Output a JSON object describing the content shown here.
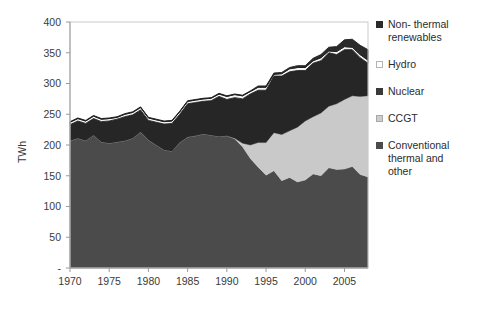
{
  "chart_data": {
    "type": "area",
    "title": "",
    "xlabel": "",
    "ylabel": "TWh",
    "xlim": [
      1970,
      2008
    ],
    "ylim": [
      0,
      400
    ],
    "ytick_labels": [
      "-",
      "50",
      "100",
      "150",
      "200",
      "250",
      "300",
      "350",
      "400"
    ],
    "ytick_values": [
      0,
      50,
      100,
      150,
      200,
      250,
      300,
      350,
      400
    ],
    "xtick_labels": [
      "1970",
      "1975",
      "1980",
      "1985",
      "1990",
      "1995",
      "2000",
      "2005"
    ],
    "xtick_values": [
      1970,
      1975,
      1980,
      1985,
      1990,
      1995,
      2000,
      2005
    ],
    "grid": false,
    "stacked": true,
    "legend_position": "right",
    "x": [
      1970,
      1971,
      1972,
      1973,
      1974,
      1975,
      1976,
      1977,
      1978,
      1979,
      1980,
      1981,
      1982,
      1983,
      1984,
      1985,
      1986,
      1987,
      1988,
      1989,
      1990,
      1991,
      1992,
      1993,
      1994,
      1995,
      1996,
      1997,
      1998,
      1999,
      2000,
      2001,
      2002,
      2003,
      2004,
      2005,
      2006,
      2007,
      2008
    ],
    "series": [
      {
        "name": "Conventional thermal and other",
        "color": "#4b4b4b",
        "values": [
          207,
          211,
          207,
          216,
          205,
          203,
          205,
          207,
          211,
          221,
          208,
          200,
          192,
          190,
          204,
          213,
          215,
          218,
          216,
          214,
          215,
          210,
          197,
          178,
          164,
          151,
          158,
          142,
          147,
          140,
          143,
          153,
          150,
          163,
          160,
          161,
          165,
          152,
          148
        ]
      },
      {
        "name": "CCGT",
        "color": "#c9c9c9",
        "values": [
          0,
          0,
          0,
          0,
          0,
          0,
          0,
          0,
          0,
          0,
          0,
          0,
          0,
          0,
          0,
          0,
          0,
          0,
          0,
          0,
          0,
          1,
          6,
          22,
          40,
          53,
          62,
          75,
          76,
          89,
          96,
          93,
          102,
          100,
          107,
          113,
          115,
          127,
          132
        ]
      },
      {
        "name": "Nuclear",
        "color": "#262626",
        "values": [
          26,
          28,
          28,
          27,
          33,
          36,
          37,
          39,
          38,
          36,
          32,
          37,
          42,
          45,
          46,
          54,
          54,
          53,
          56,
          65,
          59,
          66,
          72,
          83,
          85,
          85,
          92,
          95,
          96,
          92,
          82,
          87,
          85,
          87,
          80,
          81,
          75,
          63,
          53
        ]
      },
      {
        "name": "Hydro",
        "color": "#f4f4f4",
        "values": [
          4,
          4,
          4,
          4,
          4,
          4,
          3,
          4,
          4,
          4,
          4,
          4,
          4,
          4,
          4,
          4,
          4,
          4,
          4,
          4,
          5,
          5,
          5,
          4,
          5,
          5,
          3,
          4,
          5,
          5,
          5,
          4,
          5,
          3,
          5,
          5,
          4,
          5,
          5
        ]
      },
      {
        "name": "Non- thermal renewables",
        "color": "#2b2b2b",
        "values": [
          1,
          1,
          1,
          1,
          1,
          1,
          1,
          1,
          1,
          1,
          1,
          1,
          1,
          1,
          1,
          1,
          1,
          1,
          1,
          1,
          1,
          1,
          1,
          1,
          2,
          2,
          2,
          2,
          2,
          3,
          3,
          4,
          5,
          6,
          8,
          11,
          13,
          15,
          17
        ]
      }
    ]
  },
  "legend": {
    "items": [
      {
        "label": "Non- thermal\nrenewables",
        "swatch_color": "#2b2b2b",
        "swatch_border": "#2b2b2b"
      },
      {
        "label": "Hydro",
        "swatch_color": "#ffffff",
        "swatch_border": "#b4b4b4"
      },
      {
        "label": "Nuclear",
        "swatch_color": "#3a3a3a",
        "swatch_border": "#3a3a3a"
      },
      {
        "label": "CCGT",
        "swatch_color": "#cdcdcd",
        "swatch_border": "#a8a8a8"
      },
      {
        "label": "Conventional\nthermal and\nother",
        "swatch_color": "#4b4b4b",
        "swatch_border": "#4b4b4b"
      }
    ]
  }
}
